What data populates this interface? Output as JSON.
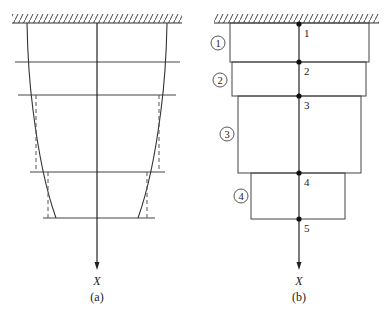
{
  "panel_a": {
    "caption": "(a)",
    "axis_label": "X",
    "description": "Tapered bar fixed at top with curved outer profile approximated by stepped (dashed) segments"
  },
  "panel_b": {
    "caption": "(b)",
    "axis_label": "X",
    "nodes": [
      "1",
      "2",
      "3",
      "4",
      "5"
    ],
    "elements": [
      "1",
      "2",
      "3",
      "4"
    ]
  },
  "colors": {
    "line": "#333333",
    "background": "#ffffff"
  }
}
